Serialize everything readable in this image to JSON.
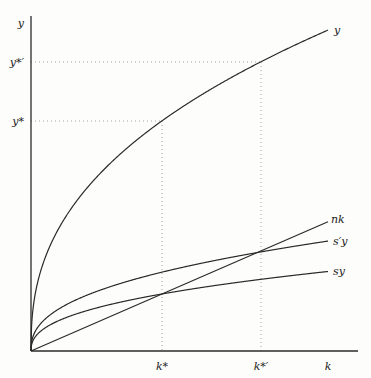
{
  "chart_data": {
    "type": "line",
    "title": "",
    "xlabel": "k",
    "ylabel": "y",
    "grid": false,
    "alpha": 0.406,
    "A": 31.8,
    "kmax": 297,
    "series": [
      {
        "name": "y",
        "label": "y",
        "form": "A*k^alpha",
        "scale": 1.0
      },
      {
        "name": "s'y",
        "label": "s′y",
        "form": "s'*A*k^alpha",
        "scale": 0.3426
      },
      {
        "name": "sy",
        "label": "sy",
        "form": "s*A*k^alpha",
        "scale": 0.2478
      },
      {
        "name": "nk",
        "label": "nk",
        "form": "n*k",
        "slope": 0.435
      }
    ],
    "x_ticks": [
      {
        "label": "k*",
        "value": 131
      },
      {
        "label": "k*′",
        "value": 230
      },
      {
        "label": "k",
        "value": 297
      }
    ],
    "y_ticks": [
      {
        "label": "y*",
        "value": 230
      },
      {
        "label": "y*′",
        "value": 289
      },
      {
        "label": "y",
        "value": 335
      }
    ],
    "annotations": [
      "dotted guide lines from k* to y* and from k*′ to y*′"
    ],
    "colors": {
      "line": "#2a2a2a",
      "guide": "#8a8a8a"
    }
  }
}
